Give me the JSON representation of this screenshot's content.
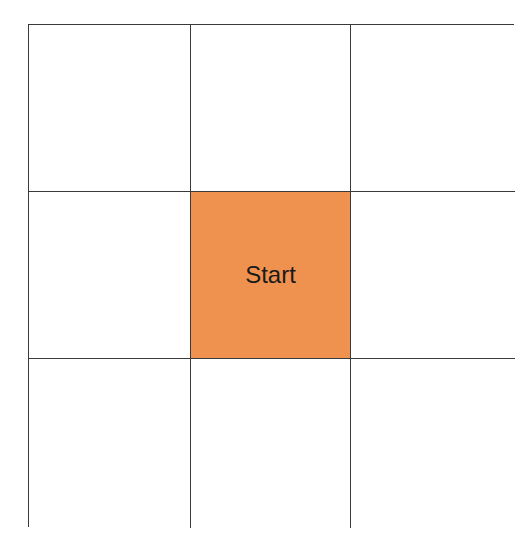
{
  "grid": {
    "rows": 3,
    "cols": 3,
    "start_color": "#f0924f",
    "cells": [
      {
        "row": 1,
        "col": 1,
        "label": ""
      },
      {
        "row": 1,
        "col": 2,
        "label": ""
      },
      {
        "row": 1,
        "col": 3,
        "label": ""
      },
      {
        "row": 2,
        "col": 1,
        "label": ""
      },
      {
        "row": 2,
        "col": 2,
        "label": "Start"
      },
      {
        "row": 2,
        "col": 3,
        "label": ""
      },
      {
        "row": 3,
        "col": 1,
        "label": ""
      },
      {
        "row": 3,
        "col": 2,
        "label": ""
      },
      {
        "row": 3,
        "col": 3,
        "label": ""
      }
    ]
  }
}
